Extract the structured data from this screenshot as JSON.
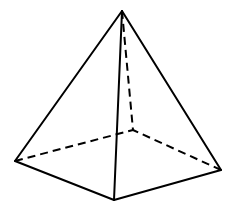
{
  "figure": {
    "type": "square-pyramid",
    "stroke_color": "#000000",
    "background": "#ffffff"
  },
  "vertices": {
    "apex": {
      "x": 122,
      "y": 11
    },
    "left": {
      "x": 15,
      "y": 161
    },
    "front": {
      "x": 114,
      "y": 200
    },
    "right": {
      "x": 221,
      "y": 170
    },
    "back_hidden": {
      "x": 133,
      "y": 130
    }
  },
  "edges": {
    "visible": [
      [
        "apex",
        "left"
      ],
      [
        "apex",
        "front"
      ],
      [
        "apex",
        "right"
      ],
      [
        "left",
        "front"
      ],
      [
        "front",
        "right"
      ]
    ],
    "hidden": [
      [
        "apex",
        "back_hidden"
      ],
      [
        "left",
        "back_hidden"
      ],
      [
        "right",
        "back_hidden"
      ]
    ]
  }
}
